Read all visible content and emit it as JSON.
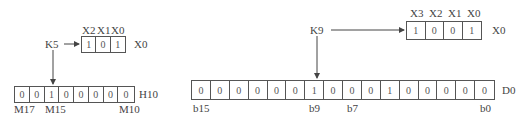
{
  "left": {
    "constant": "K5",
    "input_register": {
      "name": "X0",
      "bit_labels": [
        "X2",
        "X1",
        "X0"
      ],
      "bits": [
        "1",
        "0",
        "1"
      ]
    },
    "output_register": {
      "name": "H10",
      "bits": [
        "0",
        "0",
        "1",
        "0",
        "0",
        "0",
        "0",
        "0"
      ],
      "bit_labels": {
        "msb": "M17",
        "mid": "M15",
        "lsb": "M10"
      }
    }
  },
  "right": {
    "constant": "K9",
    "input_register": {
      "name": "X0",
      "bit_labels": [
        "X3",
        "X2",
        "X1",
        "X0"
      ],
      "bits": [
        "1",
        "0",
        "0",
        "1"
      ]
    },
    "output_register": {
      "name": "D0",
      "bits": [
        "0",
        "0",
        "0",
        "0",
        "0",
        "0",
        "1",
        "0",
        "0",
        "0",
        "1",
        "0",
        "0",
        "0",
        "0",
        "0"
      ],
      "bit_labels": {
        "b15": "b15",
        "b9": "b9",
        "b7": "b7",
        "b0": "b0"
      }
    }
  }
}
